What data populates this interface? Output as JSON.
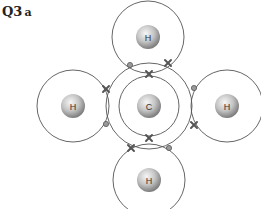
{
  "question": {
    "number": "Q3",
    "part": "a"
  },
  "diagram": {
    "central_atom": {
      "symbol": "C",
      "cx": 149,
      "cy": 106,
      "inner_shell_r": 30,
      "outer_shell_r": 43
    },
    "hydrogens": [
      {
        "symbol": "H",
        "position": "top",
        "cx": 148,
        "cy": 37,
        "r": 36
      },
      {
        "symbol": "H",
        "position": "left",
        "cx": 73,
        "cy": 106,
        "r": 36
      },
      {
        "symbol": "H",
        "position": "right",
        "cx": 227,
        "cy": 106,
        "r": 36
      },
      {
        "symbol": "H",
        "position": "bottom",
        "cx": 149,
        "cy": 180,
        "r": 36
      }
    ],
    "electrons": [
      {
        "type": "dot",
        "x": 130,
        "y": 65
      },
      {
        "type": "cross",
        "x": 168,
        "y": 63
      },
      {
        "type": "cross",
        "x": 106,
        "y": 89
      },
      {
        "type": "dot",
        "x": 106,
        "y": 124
      },
      {
        "type": "dot",
        "x": 194,
        "y": 88
      },
      {
        "type": "cross",
        "x": 194,
        "y": 125
      },
      {
        "type": "cross",
        "x": 131,
        "y": 148
      },
      {
        "type": "dot",
        "x": 169,
        "y": 148
      },
      {
        "type": "cross",
        "x": 149,
        "y": 74
      },
      {
        "type": "cross",
        "x": 149,
        "y": 138
      }
    ],
    "colors": {
      "shell": "#555555",
      "electron": "#555555",
      "nucleus_light": "#f4f4f4",
      "nucleus_dark": "#8a8a8a"
    }
  }
}
